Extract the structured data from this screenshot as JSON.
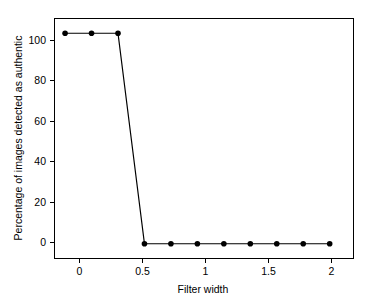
{
  "chart_data": {
    "type": "line",
    "title": "",
    "xlabel": "Filter width",
    "ylabel": "Percentage of images detected as authentic",
    "xlim": [
      -0.08,
      2.18
    ],
    "ylim": [
      -7,
      107
    ],
    "grid": false,
    "legend": null,
    "marker": "filled-circle",
    "line_color": "#000000",
    "x": [
      0,
      0.2,
      0.4,
      0.6,
      0.8,
      1.0,
      1.2,
      1.4,
      1.6,
      1.8,
      2.0
    ],
    "values": [
      100,
      100,
      100,
      0,
      0,
      0,
      0,
      0,
      0,
      0,
      0
    ],
    "series": [
      {
        "name": "Percentage of images detected as authentic",
        "values": [
          100,
          100,
          100,
          0,
          0,
          0,
          0,
          0,
          0,
          0,
          0
        ]
      }
    ],
    "xticks": [
      {
        "value": 0,
        "label": "0"
      },
      {
        "value": 0.5,
        "label": "0.5"
      },
      {
        "value": 1,
        "label": "1"
      },
      {
        "value": 1.5,
        "label": "1.5"
      },
      {
        "value": 2,
        "label": "2"
      }
    ],
    "yticks": [
      {
        "value": 0,
        "label": "0"
      },
      {
        "value": 20,
        "label": "20"
      },
      {
        "value": 40,
        "label": "40"
      },
      {
        "value": 60,
        "label": "60"
      },
      {
        "value": 80,
        "label": "80"
      },
      {
        "value": 100,
        "label": "100"
      }
    ]
  },
  "axis": {
    "x_title": "Filter width",
    "y_title": "Percentage of images detected as authentic"
  },
  "xtick_labels": {
    "t0": "0",
    "t1": "0.5",
    "t2": "1",
    "t3": "1.5",
    "t4": "2"
  },
  "ytick_labels": {
    "t0": "0",
    "t1": "20",
    "t2": "40",
    "t3": "60",
    "t4": "80",
    "t5": "100"
  }
}
